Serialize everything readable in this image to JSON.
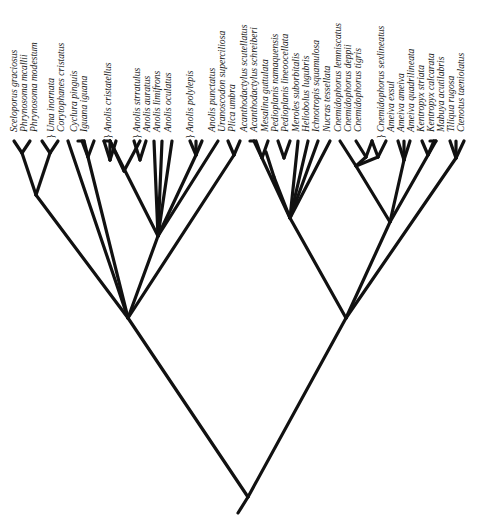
{
  "colors": {
    "branch": "#111111",
    "label": "#1a1a1a",
    "background": "#ffffff"
  },
  "tips": [
    {
      "label": "Sceloporus graciosus",
      "x": 14
    },
    {
      "label": "Phrynosoma mcallii",
      "x": 24
    },
    {
      "label": "Phrynosoma modestum",
      "x": 34
    },
    {
      "label": "Uma inornata",
      "x": 51,
      "brace": true
    },
    {
      "label": "Corytophanes cristatus",
      "x": 61
    },
    {
      "label": "Cyclura pinguis",
      "x": 74
    },
    {
      "label": "Iguana iguana",
      "x": 84
    },
    {
      "label": "Anolis cristatellus",
      "x": 108,
      "brace": true
    },
    {
      "label": "Anolis strratulus",
      "x": 137,
      "brace": true
    },
    {
      "label": "Anolis auratus",
      "x": 147
    },
    {
      "label": "Anolis limifrons",
      "x": 157
    },
    {
      "label": "Anolis oculatus",
      "x": 168
    },
    {
      "label": "Anolis polylepis",
      "x": 190,
      "brace": true
    },
    {
      "label": "Anolis punctatus",
      "x": 212
    },
    {
      "label": "Uranoscodon superciliosa",
      "x": 222
    },
    {
      "label": "Plica umbra",
      "x": 232
    },
    {
      "label": "Acanthodactylus scutellatus",
      "x": 244
    },
    {
      "label": "Acanthodactylus schreiberi",
      "x": 254
    },
    {
      "label": "Mesalina guttulata",
      "x": 265
    },
    {
      "label": "Pedioplanis namaquensis",
      "x": 275
    },
    {
      "label": "Pedioplanis lineoocellata",
      "x": 285
    },
    {
      "label": "Meroles suborbitalis",
      "x": 296
    },
    {
      "label": "Heliobolus lugubris",
      "x": 306
    },
    {
      "label": "Ichnotropis squamulosa",
      "x": 316
    },
    {
      "label": "Nucras tessellata",
      "x": 327
    },
    {
      "label": "Cnemidophorus lemniscatus",
      "x": 338
    },
    {
      "label": "Cnemidophorus deppii",
      "x": 348
    },
    {
      "label": "Cnemidophorus tigris",
      "x": 358
    },
    {
      "label": "Cnemidophorus sexlineatus",
      "x": 381,
      "brace": true
    },
    {
      "label": "Ameiva exsul",
      "x": 391
    },
    {
      "label": "Ameiva ameiva",
      "x": 401
    },
    {
      "label": "Ameiva quadrilineata",
      "x": 411
    },
    {
      "label": "Kentropyx striata",
      "x": 421
    },
    {
      "label": "Kentropyx calcarata",
      "x": 431
    },
    {
      "label": "Mabuya acutilabris",
      "x": 441
    },
    {
      "label": "Tiliqua rugosa",
      "x": 451
    },
    {
      "label": "Ctenotus taeniolatus",
      "x": 461
    }
  ],
  "branches": [
    [
      238,
      513,
      248,
      497
    ],
    [
      248,
      497,
      128,
      318
    ],
    [
      248,
      497,
      346,
      318
    ],
    [
      128,
      318,
      36,
      195
    ],
    [
      36,
      195,
      22,
      153
    ],
    [
      36,
      195,
      50,
      153
    ],
    [
      22,
      153,
      14,
      141
    ],
    [
      22,
      153,
      30,
      141
    ],
    [
      50,
      153,
      42,
      141
    ],
    [
      50,
      153,
      58,
      141
    ],
    [
      128,
      318,
      68,
      141
    ],
    [
      128,
      318,
      84,
      141
    ],
    [
      84,
      141,
      78,
      141
    ],
    [
      88,
      157,
      82,
      141
    ],
    [
      88,
      157,
      94,
      141
    ],
    [
      128,
      318,
      158,
      236
    ],
    [
      158,
      236,
      110,
      141
    ],
    [
      124,
      171,
      110,
      141
    ],
    [
      124,
      171,
      140,
      141
    ],
    [
      110,
      141,
      104,
      141
    ],
    [
      110,
      160,
      104,
      141
    ],
    [
      110,
      160,
      116,
      141
    ],
    [
      110,
      160,
      110,
      141
    ],
    [
      140,
      160,
      134,
      141
    ],
    [
      140,
      160,
      146,
      141
    ],
    [
      158,
      236,
      154,
      141
    ],
    [
      158,
      236,
      162,
      141
    ],
    [
      158,
      236,
      172,
      141
    ],
    [
      158,
      236,
      196,
      155
    ],
    [
      196,
      155,
      190,
      141
    ],
    [
      196,
      155,
      202,
      141
    ],
    [
      196,
      155,
      196,
      141
    ],
    [
      158,
      236,
      218,
      141
    ],
    [
      128,
      318,
      234,
      155
    ],
    [
      234,
      155,
      228,
      141
    ],
    [
      234,
      155,
      240,
      141
    ],
    [
      346,
      318,
      290,
      218
    ],
    [
      290,
      218,
      254,
      141
    ],
    [
      254,
      141,
      250,
      141
    ],
    [
      262,
      158,
      256,
      141
    ],
    [
      262,
      158,
      268,
      141
    ],
    [
      290,
      218,
      274,
      177
    ],
    [
      274,
      177,
      266,
      152
    ],
    [
      284,
      158,
      278,
      141
    ],
    [
      284,
      158,
      290,
      141
    ],
    [
      290,
      218,
      298,
      141
    ],
    [
      290,
      218,
      308,
      141
    ],
    [
      290,
      218,
      318,
      141
    ],
    [
      290,
      218,
      330,
      141
    ],
    [
      346,
      318,
      390,
      222
    ],
    [
      390,
      222,
      356,
      166
    ],
    [
      356,
      166,
      340,
      141
    ],
    [
      366,
      157,
      356,
      141
    ],
    [
      366,
      157,
      372,
      141
    ],
    [
      378,
      157,
      372,
      141
    ],
    [
      378,
      157,
      386,
      141
    ],
    [
      356,
      166,
      366,
      157
    ],
    [
      356,
      166,
      378,
      157
    ],
    [
      390,
      222,
      404,
      160
    ],
    [
      404,
      160,
      398,
      141
    ],
    [
      404,
      160,
      410,
      141
    ],
    [
      404,
      160,
      404,
      141
    ],
    [
      390,
      222,
      436,
      141
    ],
    [
      436,
      141,
      430,
      141
    ],
    [
      428,
      155,
      422,
      141
    ],
    [
      428,
      155,
      434,
      141
    ],
    [
      346,
      318,
      456,
      158
    ],
    [
      456,
      158,
      450,
      141
    ],
    [
      456,
      158,
      464,
      141
    ],
    [
      456,
      158,
      456,
      141
    ]
  ]
}
